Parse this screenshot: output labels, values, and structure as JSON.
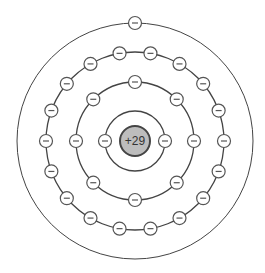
{
  "nucleus": {
    "label": "+29",
    "fill": "#bdbdbd",
    "stroke": "#444444"
  },
  "electron": {
    "label": "−",
    "fill": "#ffffff",
    "stroke": "#555555"
  },
  "center": [
    135,
    141
  ],
  "shells": [
    {
      "radius": 30,
      "electrons": 2,
      "start_angle": 180
    },
    {
      "radius": 59,
      "electrons": 8,
      "start_angle": 180
    },
    {
      "radius": 89,
      "electrons": 18,
      "start_angle": 180
    },
    {
      "radius": 118,
      "electrons": 1,
      "start_angle": 90
    }
  ]
}
